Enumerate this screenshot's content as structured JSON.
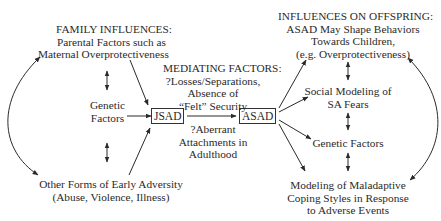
{
  "diagram": {
    "family_influences": {
      "heading": "FAMILY INFLUENCES:",
      "line1": "Parental Factors such as",
      "line2": "Maternal Overprotectiveness"
    },
    "genetic_factors_left": {
      "line1": "Genetic",
      "line2": "Factors"
    },
    "early_adversity": {
      "line1": "Other Forms of Early Adversity",
      "line2": "(Abuse, Violence, Illness)"
    },
    "jsad_box": "JSAD",
    "asad_box": "ASAD",
    "mediating_factors": {
      "heading": "MEDIATING FACTORS:",
      "line1": "?Losses/Separations,",
      "line2": "Absence of",
      "line3": "“Felt” Security",
      "line4": "?Aberrant",
      "line5": "Attachments in",
      "line6": "Adulthood"
    },
    "influences_on_offspring": {
      "heading": "INFLUENCES ON OFFSPRING:",
      "line1": "ASAD May Shape Behaviors",
      "line2": "Towards Children,",
      "line3": "(e.g. Overprotectiveness)"
    },
    "social_modeling": {
      "line1": "Social Modeling of",
      "line2": "SA Fears"
    },
    "genetic_factors_right": "Genetic Factors",
    "maladaptive_coping": {
      "line1": "Modeling of Maladaptive",
      "line2": "Coping Styles in Response",
      "line3": "to Adverse Events"
    }
  }
}
